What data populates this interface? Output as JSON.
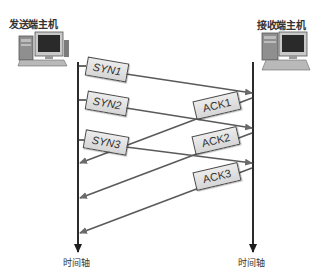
{
  "hosts": {
    "sender": {
      "label": "发送端主机",
      "icon": "desktop-computer-icon"
    },
    "receiver": {
      "label": "接收端主机",
      "icon": "desktop-computer-icon"
    }
  },
  "axes": {
    "sender_axis_label": "时间轴",
    "receiver_axis_label": "时间轴"
  },
  "segments": [
    {
      "label": "SYN1",
      "direction": "sender-to-receiver"
    },
    {
      "label": "SYN2",
      "direction": "sender-to-receiver"
    },
    {
      "label": "SYN3",
      "direction": "sender-to-receiver"
    }
  ],
  "acks": [
    {
      "label": "ACK1",
      "direction": "receiver-to-sender"
    },
    {
      "label": "ACK2",
      "direction": "receiver-to-sender"
    },
    {
      "label": "ACK3",
      "direction": "receiver-to-sender"
    }
  ],
  "colors": {
    "axis": "#2b2b2b",
    "arrow": "#555555",
    "box_fill": "#dddddd",
    "box_border": "#4a4a4a",
    "text": "#333333"
  }
}
